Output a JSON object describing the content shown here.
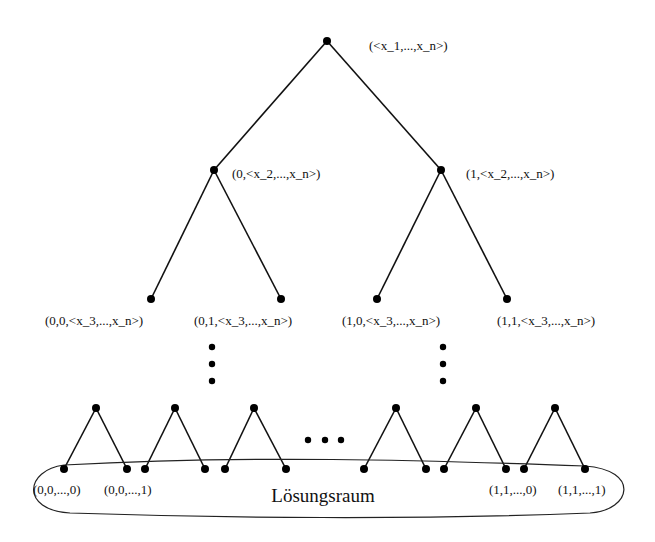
{
  "diagram": {
    "type": "binary-search-tree",
    "colors": {
      "ink": "#111111",
      "background": "#ffffff"
    },
    "root": {
      "label": "(<x_1,...,x_n>)"
    },
    "level1": [
      {
        "label": "(0,<x_2,...,x_n>)"
      },
      {
        "label": "(1,<x_2,...,x_n>)"
      }
    ],
    "level2": [
      {
        "label": "(0,0,<x_3,...,x_n>)"
      },
      {
        "label": "(0,1,<x_3,...,x_n>)"
      },
      {
        "label": "(1,0,<x_3,...,x_n>)"
      },
      {
        "label": "(1,1,<x_3,...,x_n>)"
      }
    ],
    "leaf_labels": [
      {
        "label": "(0,0,...,0)"
      },
      {
        "label": "(0,0,...,1)"
      },
      {
        "label": "(1,1,...,0)"
      },
      {
        "label": "(1,1,...,1)"
      }
    ],
    "solution_space": {
      "label": "Lösungsraum"
    },
    "ellipsis": {
      "vertical": "⋮",
      "horizontal": "…"
    }
  }
}
